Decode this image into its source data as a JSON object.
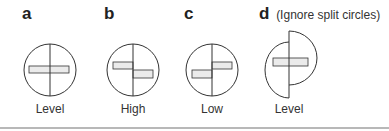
{
  "panels": [
    {
      "letter": "a",
      "note": "",
      "caption": "Level",
      "type": "level"
    },
    {
      "letter": "b",
      "note": "",
      "caption": "High",
      "type": "high"
    },
    {
      "letter": "c",
      "note": "",
      "caption": "Low",
      "type": "low"
    },
    {
      "letter": "d",
      "note": "(Ignore split circles)",
      "caption": "Level",
      "type": "split-level"
    }
  ],
  "colors": {
    "stroke": "#333333",
    "bar_fill": "#ebebeb",
    "divider": "#b8b8b8"
  }
}
